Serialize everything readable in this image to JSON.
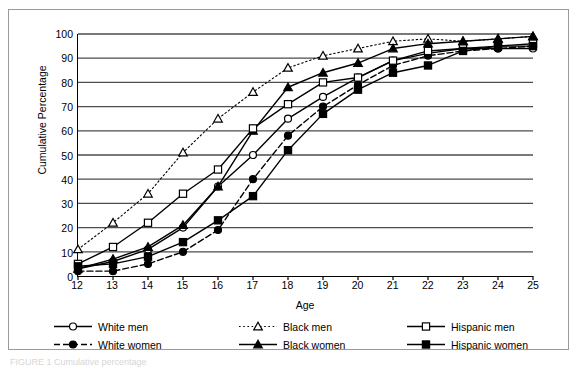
{
  "figure": {
    "caption_faint": "FIGURE 1  Cumulative percentage"
  },
  "chart_data": {
    "type": "line",
    "title": "",
    "xlabel": "Age",
    "ylabel": "Cumulative Percentage",
    "xlim": [
      12,
      25
    ],
    "ylim": [
      0,
      100
    ],
    "xticks": [
      12,
      13,
      14,
      15,
      16,
      17,
      18,
      19,
      20,
      21,
      22,
      23,
      24,
      25
    ],
    "yticks": [
      0,
      10,
      20,
      30,
      40,
      50,
      60,
      70,
      80,
      90,
      100
    ],
    "grid": "horizontal",
    "legend_position": "below-axes",
    "x": [
      12,
      13,
      14,
      15,
      16,
      17,
      18,
      19,
      20,
      21,
      22,
      23,
      24,
      25
    ],
    "series": [
      {
        "name": "White men",
        "marker": "open-circle",
        "line": "solid",
        "values": [
          3,
          6,
          11,
          20,
          37,
          50,
          65,
          74,
          82,
          89,
          92,
          94,
          94,
          94
        ]
      },
      {
        "name": "White women",
        "marker": "filled-circle",
        "line": "dashed",
        "values": [
          2,
          2,
          5,
          10,
          19,
          40,
          58,
          70,
          79,
          87,
          91,
          93,
          94,
          95
        ]
      },
      {
        "name": "Black men",
        "marker": "open-triangle",
        "line": "dotted",
        "values": [
          11,
          22,
          34,
          51,
          65,
          76,
          86,
          91,
          94,
          97,
          98,
          97,
          98,
          99
        ]
      },
      {
        "name": "Black women",
        "marker": "filled-triangle",
        "line": "solid",
        "values": [
          3,
          7,
          12,
          21,
          37,
          60,
          78,
          84,
          88,
          94,
          96,
          97,
          98,
          99
        ]
      },
      {
        "name": "Hispanic men",
        "marker": "open-square",
        "line": "solid",
        "values": [
          5,
          12,
          22,
          34,
          44,
          61,
          71,
          80,
          82,
          89,
          93,
          94,
          95,
          96
        ]
      },
      {
        "name": "Hispanic women",
        "marker": "filled-square",
        "line": "solid",
        "values": [
          4,
          5,
          8,
          14,
          23,
          33,
          52,
          67,
          77,
          84,
          87,
          93,
          95,
          95
        ]
      }
    ]
  },
  "legend": {
    "items": [
      {
        "label": "White men",
        "marker": "open-circle",
        "line": "solid"
      },
      {
        "label": "White women",
        "marker": "filled-circle",
        "line": "dashed"
      },
      {
        "label": "Black men",
        "marker": "open-triangle",
        "line": "dotted"
      },
      {
        "label": "Black women",
        "marker": "filled-triangle",
        "line": "solid"
      },
      {
        "label": "Hispanic men",
        "marker": "open-square",
        "line": "solid"
      },
      {
        "label": "Hispanic women",
        "marker": "filled-square",
        "line": "solid"
      }
    ]
  },
  "colors": {
    "ink": "#000000",
    "grid": "#4d4d4d",
    "frame": "#9a9a9a"
  }
}
